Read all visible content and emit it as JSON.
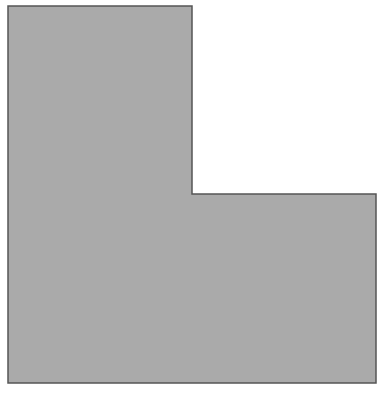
{
  "diagram": {
    "shape": "l-shape-polygon",
    "background_color": "#ffffff",
    "fill_color": "#aaaaaa",
    "stroke_color": "#555555",
    "stroke_width": 1.5,
    "points": "8,6 192,6 192,194 376,194 376,383 8,383"
  }
}
